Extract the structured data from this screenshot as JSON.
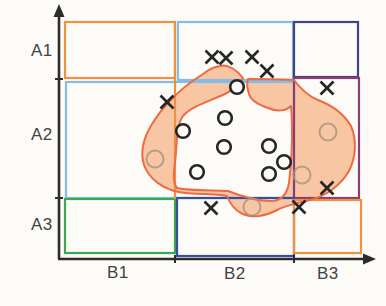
{
  "diagram": {
    "width": 386,
    "height": 306,
    "background": "#fcfbf7",
    "axes": {
      "color": "#2c2c2c",
      "stroke_width": 2.6,
      "origin": [
        59,
        259
      ],
      "x_end": 364,
      "y_end": 16,
      "x_arrow_tip": 376,
      "y_arrow_tip": 4,
      "x_ticks": [
        175,
        294
      ],
      "y_ticks": [
        79,
        198
      ],
      "row_labels": [
        "A1",
        "A2",
        "A3"
      ],
      "col_labels": [
        "B1",
        "B2",
        "B3"
      ]
    },
    "regions": [
      {
        "name": "cell-A1-B1",
        "color": "#ec9241",
        "x": 65,
        "y": 22,
        "w": 110,
        "h": 56
      },
      {
        "name": "cell-A1-B2",
        "color": "#82bee6",
        "x": 178,
        "y": 22,
        "w": 115,
        "h": 58
      },
      {
        "name": "cell-A1-B3",
        "color": "#3e4584",
        "x": 294,
        "y": 22,
        "w": 64,
        "h": 55
      },
      {
        "name": "cell-A2-B1B2",
        "color": "#82bee6",
        "x": 66,
        "y": 82,
        "w": 228,
        "h": 116
      },
      {
        "name": "cell-A2-B3",
        "color": "#8a3d74",
        "x": 294,
        "y": 78,
        "w": 65,
        "h": 120
      },
      {
        "name": "cell-A3-B1",
        "color": "#3fa653",
        "x": 65,
        "y": 199,
        "w": 110,
        "h": 54
      },
      {
        "name": "cell-A3-B2",
        "color": "#374f9b",
        "x": 177,
        "y": 198,
        "w": 117,
        "h": 58
      },
      {
        "name": "cell-A3-B3",
        "color": "#ec9241",
        "x": 294,
        "y": 200,
        "w": 67,
        "h": 53
      }
    ],
    "divider": {
      "color": "#ec9241",
      "x1": 175,
      "y1": 23,
      "x2": 175,
      "y2": 199
    },
    "blob": {
      "fill": "#f7ba90",
      "fill_opacity": 0.82,
      "stroke": "#ed6a45",
      "stroke_width": 2,
      "path": "M220,66 C228,64 237,70 243,78 C240,85 233,90 225,94 C210,101 192,106 183,116 C177,124 177,138 176,152 C175,167 171,181 177,188 C191,191 211,190 228,191 C243,197 258,201 271,201 C281,201 287,194 289,183 C291,168 292,153 292,139 C292,126 292,114 291,106 C286,111 277,112 268,108 C259,105 251,101 249,94 C247,88 247,82 248,79 C263,79 279,79 294,80 C300,88 308,96 318,100 C331,105 344,114 351,126 C357,140 356,157 349,171 C341,185 326,196 310,200 C298,203 287,205 277,210 C266,216 252,219 241,213 C233,209 229,201 227,196 C212,193 195,195 179,192 C163,189 149,179 144,165 C140,152 144,137 152,124 C159,113 163,108 168,103 C177,93 190,82 203,74 C208,70 214,67 220,66 Z"
    },
    "markers": {
      "cross": {
        "color": "#262626",
        "size": 13,
        "points": [
          [
            212,
            57
          ],
          [
            226,
            58
          ],
          [
            252,
            57
          ],
          [
            267,
            71
          ],
          [
            167,
            102
          ],
          [
            327,
            88
          ],
          [
            327,
            188
          ],
          [
            299,
            207
          ],
          [
            211,
            208
          ]
        ]
      },
      "circle": {
        "color": "#262626",
        "radius": 6.8,
        "points": [
          [
            237,
            87
          ],
          [
            225,
            118
          ],
          [
            183,
            131
          ],
          [
            224,
            147
          ],
          [
            269,
            146
          ],
          [
            284,
            162
          ],
          [
            269,
            174
          ],
          [
            197,
            172
          ]
        ]
      },
      "faint_circle": {
        "color": "#a7937e",
        "radius": 8.5,
        "points": [
          [
            155,
            159
          ],
          [
            328,
            132
          ],
          [
            302,
            175
          ],
          [
            252,
            207
          ]
        ]
      }
    }
  }
}
